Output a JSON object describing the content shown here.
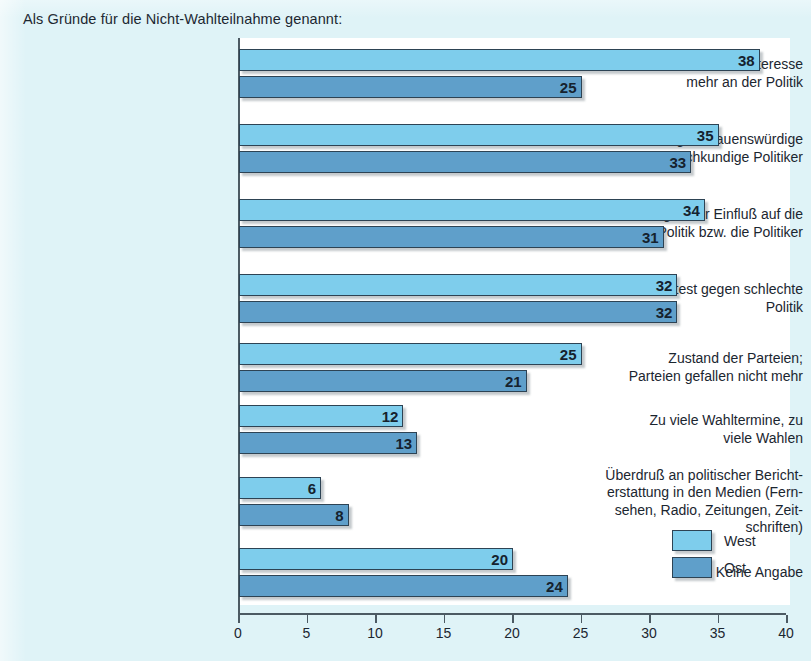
{
  "chart_data": {
    "type": "bar",
    "orientation": "horizontal",
    "title": "Als Gründe für die Nicht-Wahlteilnahme genannt:",
    "xlabel": "",
    "ylabel": "",
    "xlim": [
      0,
      40
    ],
    "xticks": [
      0,
      5,
      10,
      15,
      20,
      25,
      30,
      35,
      40
    ],
    "xtick_labels": [
      "0",
      "5",
      "10",
      "15",
      "20",
      "25",
      "30",
      "35",
      "40"
    ],
    "grid": false,
    "legend_position": "bottom-right",
    "categories": [
      "Kein Interesse\nmehr an der Politik",
      "Zu wenig vertrauenswürdige\nund sachkundige Politiker",
      "Mangelnder Einfluß auf die\nPolitik bzw. die Politiker",
      "Protest gegen schlechte\nPolitik",
      "Zustand der Parteien;\nParteien gefallen nicht mehr",
      "Zu viele Wahltermine, zu\nviele Wahlen",
      "Überdruß an politischer Bericht-\nerstattung in den Medien (Fern-\nsehen, Radio, Zeitungen, Zeit-\nschriften)",
      "Keine Angabe"
    ],
    "category_lines": [
      [
        "Kein Interesse",
        "mehr an der Politik"
      ],
      [
        "Zu wenig vertrauenswürdige",
        "und sachkundige Politiker"
      ],
      [
        "Mangelnder Einfluß auf die",
        "Politik bzw. die Politiker"
      ],
      [
        "Protest gegen schlechte",
        "Politik"
      ],
      [
        "Zustand der Parteien;",
        "Parteien gefallen nicht mehr"
      ],
      [
        "Zu viele Wahltermine, zu",
        "viele Wahlen"
      ],
      [
        "Überdruß an politischer Bericht-",
        "erstattung in den Medien (Fern-",
        "sehen, Radio, Zeitungen, Zeit-",
        "schriften)"
      ],
      [
        "Keine Angabe"
      ]
    ],
    "series": [
      {
        "name": "West",
        "color": "#7ecdec",
        "values": [
          38,
          35,
          34,
          32,
          25,
          12,
          6,
          20
        ]
      },
      {
        "name": "Ost",
        "color": "#5f9fca",
        "values": [
          25,
          33,
          31,
          32,
          21,
          13,
          8,
          24
        ]
      }
    ]
  },
  "legend": {
    "items": [
      {
        "label": "West",
        "color": "#7ecdec"
      },
      {
        "label": "Ost",
        "color": "#5f9fca"
      }
    ]
  },
  "colors": {
    "background": "#dff3f7",
    "plot_background": "#ffffff",
    "axis": "#4c5a63",
    "bar_outline": "#2d4354",
    "west": "#7ecdec",
    "ost": "#5f9fca",
    "text": "#1b2630"
  }
}
